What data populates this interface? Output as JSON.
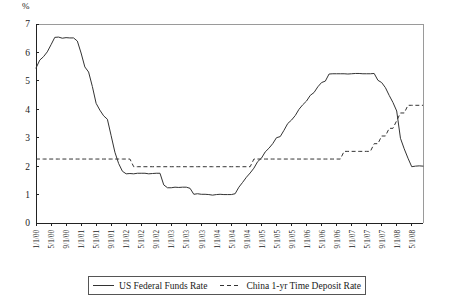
{
  "chart_data": {
    "type": "line",
    "title": "",
    "subtitle": "",
    "xlabel": "",
    "ylabel": "%",
    "ylim": [
      0,
      7
    ],
    "yticks": [
      0,
      1,
      2,
      3,
      4,
      5,
      6,
      7
    ],
    "grid": false,
    "legend_position": "bottom",
    "x_tick_labels": [
      "1/1/00",
      "5/1/00",
      "9/1/00",
      "1/1/01",
      "5/1/01",
      "9/1/01",
      "1/1/02",
      "5/1/02",
      "9/1/02",
      "1/1/03",
      "5/1/03",
      "9/1/03",
      "1/1/04",
      "5/1/04",
      "9/1/04",
      "1/1/05",
      "5/1/05",
      "9/1/05",
      "1/1/06",
      "5/1/06",
      "9/1/06",
      "1/1/07",
      "5/1/07",
      "9/1/07",
      "1/1/08",
      "5/1/08"
    ],
    "x_tick_interval_months": 4,
    "x_start": "1/1/00",
    "x_end": "8/1/08",
    "series": [
      {
        "name": "US Federal Funds Rate",
        "style": "solid",
        "color": "#333333",
        "values": [
          5.45,
          5.73,
          5.85,
          6.02,
          6.27,
          6.53,
          6.54,
          6.5,
          6.52,
          6.51,
          6.51,
          6.4,
          5.98,
          5.49,
          5.31,
          4.8,
          4.21,
          3.97,
          3.77,
          3.65,
          3.07,
          2.49,
          2.09,
          1.82,
          1.73,
          1.74,
          1.73,
          1.75,
          1.75,
          1.75,
          1.73,
          1.74,
          1.75,
          1.75,
          1.34,
          1.24,
          1.24,
          1.26,
          1.25,
          1.26,
          1.26,
          1.22,
          1.01,
          1.03,
          1.01,
          1.01,
          1.0,
          0.98,
          1.0,
          1.01,
          1.0,
          1.0,
          1.0,
          1.03,
          1.26,
          1.43,
          1.61,
          1.76,
          1.93,
          2.16,
          2.28,
          2.5,
          2.63,
          2.79,
          3.0,
          3.04,
          3.26,
          3.5,
          3.62,
          3.78,
          4.0,
          4.16,
          4.29,
          4.49,
          4.59,
          4.79,
          4.94,
          4.99,
          5.24,
          5.25,
          5.25,
          5.25,
          5.25,
          5.24,
          5.25,
          5.26,
          5.26,
          5.25,
          5.25,
          5.25,
          5.26,
          5.02,
          4.94,
          4.76,
          4.49,
          4.24,
          3.94,
          2.98,
          2.61,
          2.28,
          1.98,
          2.0,
          2.01,
          2.0
        ]
      },
      {
        "name": "China 1-yr Time Deposit Rate",
        "style": "dashed",
        "color": "#333333",
        "values": [
          2.25,
          2.25,
          2.25,
          2.25,
          2.25,
          2.25,
          2.25,
          2.25,
          2.25,
          2.25,
          2.25,
          2.25,
          2.25,
          2.25,
          2.25,
          2.25,
          2.25,
          2.25,
          2.25,
          2.25,
          2.25,
          2.25,
          2.25,
          2.25,
          2.25,
          2.25,
          1.98,
          1.98,
          1.98,
          1.98,
          1.98,
          1.98,
          1.98,
          1.98,
          1.98,
          1.98,
          1.98,
          1.98,
          1.98,
          1.98,
          1.98,
          1.98,
          1.98,
          1.98,
          1.98,
          1.98,
          1.98,
          1.98,
          1.98,
          1.98,
          1.98,
          1.98,
          1.98,
          1.98,
          1.98,
          1.98,
          1.98,
          1.98,
          2.25,
          2.25,
          2.25,
          2.25,
          2.25,
          2.25,
          2.25,
          2.25,
          2.25,
          2.25,
          2.25,
          2.25,
          2.25,
          2.25,
          2.25,
          2.25,
          2.25,
          2.25,
          2.25,
          2.25,
          2.25,
          2.25,
          2.25,
          2.25,
          2.52,
          2.52,
          2.52,
          2.52,
          2.52,
          2.52,
          2.52,
          2.52,
          2.79,
          2.79,
          3.06,
          3.06,
          3.33,
          3.33,
          3.6,
          3.87,
          3.87,
          4.14,
          4.14,
          4.14,
          4.14,
          4.14
        ]
      }
    ]
  },
  "legend": {
    "items": [
      {
        "label": "US Federal Funds Rate",
        "style": "solid"
      },
      {
        "label": "China 1-yr Time Deposit Rate",
        "style": "dashed"
      }
    ]
  }
}
